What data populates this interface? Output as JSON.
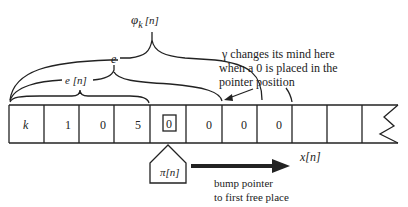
{
  "labels": {
    "phi": "φ",
    "phi_sub": "k",
    "phi_arg": "[n]",
    "e": "e",
    "e_n": "e [n]",
    "gamma_note": [
      "γ  changes its mind here",
      "when a 0 is placed in the",
      "pointer position"
    ],
    "x_n": "x[n]",
    "pi_n": "π[n]",
    "bump_note": [
      "bump pointer",
      "to first free place"
    ]
  },
  "tape": {
    "cells": [
      "k",
      "1",
      "0",
      "5",
      "0",
      "0",
      "0",
      "0",
      "",
      ""
    ],
    "pointer_index": 4
  },
  "colors": {
    "ink": "#222222",
    "background": "#ffffff"
  }
}
